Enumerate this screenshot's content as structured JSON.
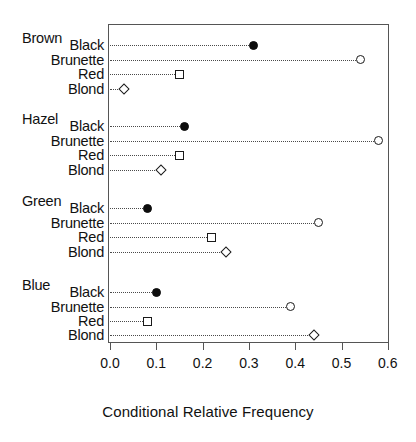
{
  "chart_data": {
    "type": "scatter",
    "subtype": "cleveland-dot-plot",
    "title": "",
    "xlabel": "Conditional Relative Frequency",
    "ylabel": "",
    "xlim": [
      0.0,
      0.6
    ],
    "xticks": [
      "0.0",
      "0.1",
      "0.2",
      "0.3",
      "0.4",
      "0.5",
      "0.6"
    ],
    "xtick_values": [
      0.0,
      0.1,
      0.2,
      0.3,
      0.4,
      0.5,
      0.6
    ],
    "grid": false,
    "legend": "none",
    "leader_lines": true,
    "groups": [
      {
        "name": "Brown",
        "points": [
          {
            "label": "Black",
            "value": 0.31,
            "marker": "filled-circle"
          },
          {
            "label": "Brunette",
            "value": 0.54,
            "marker": "open-circle"
          },
          {
            "label": "Red",
            "value": 0.15,
            "marker": "square"
          },
          {
            "label": "Blond",
            "value": 0.03,
            "marker": "diamond"
          }
        ]
      },
      {
        "name": "Hazel",
        "points": [
          {
            "label": "Black",
            "value": 0.16,
            "marker": "filled-circle"
          },
          {
            "label": "Brunette",
            "value": 0.58,
            "marker": "open-circle"
          },
          {
            "label": "Red",
            "value": 0.15,
            "marker": "square"
          },
          {
            "label": "Blond",
            "value": 0.11,
            "marker": "diamond"
          }
        ]
      },
      {
        "name": "Green",
        "points": [
          {
            "label": "Black",
            "value": 0.08,
            "marker": "filled-circle"
          },
          {
            "label": "Brunette",
            "value": 0.45,
            "marker": "open-circle"
          },
          {
            "label": "Red",
            "value": 0.22,
            "marker": "square"
          },
          {
            "label": "Blond",
            "value": 0.25,
            "marker": "diamond"
          }
        ]
      },
      {
        "name": "Blue",
        "points": [
          {
            "label": "Black",
            "value": 0.1,
            "marker": "filled-circle"
          },
          {
            "label": "Brunette",
            "value": 0.39,
            "marker": "open-circle"
          },
          {
            "label": "Red",
            "value": 0.08,
            "marker": "square"
          },
          {
            "label": "Blond",
            "value": 0.44,
            "marker": "diamond"
          }
        ]
      }
    ]
  },
  "colors": {
    "marker_fill_dark": "#0d0d0d",
    "marker_stroke": "#1a1a1a",
    "marker_fill_light": "#ffffff",
    "frame": "#555555",
    "leader": "#4a4a4a",
    "text": "#111111",
    "background": "#ffffff"
  },
  "layout": {
    "plot_left": 108,
    "plot_top": 24,
    "plot_width": 281,
    "plot_height": 319,
    "x0_px": 110,
    "px_per_unit": 463.0,
    "group_header_left": 22,
    "level_label_right": 104,
    "row_rows": [
      [
        45,
        59.5,
        74,
        89
      ],
      [
        126,
        140.5,
        155,
        170
      ],
      [
        208,
        222.5,
        237,
        252
      ],
      [
        292,
        306.5,
        321,
        335
      ]
    ],
    "group_header_y": [
      31,
      112,
      194,
      278
    ]
  }
}
